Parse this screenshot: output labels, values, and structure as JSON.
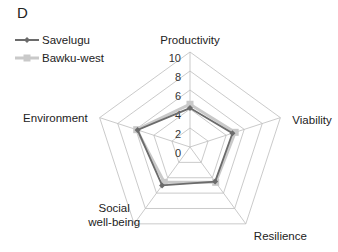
{
  "chart_data": {
    "type": "radar",
    "panel_label": "D",
    "axes": [
      "Productivity",
      "Viability",
      "Resilience",
      "Social well-being",
      "Environment"
    ],
    "axis_label_lines": [
      [
        "Productivity"
      ],
      [
        "Viability"
      ],
      [
        "Resilience"
      ],
      [
        "Social",
        "well-being"
      ],
      [
        "Environment"
      ]
    ],
    "rlim": [
      0,
      10
    ],
    "ticks": [
      0,
      2,
      4,
      6,
      8,
      10
    ],
    "tick_labels": [
      "0",
      "2",
      "4",
      "6",
      "8",
      "10"
    ],
    "grid": true,
    "legend_position": "top-left",
    "series": [
      {
        "name": "Savelugu",
        "color": "#6b6b6b",
        "marker": "diamond",
        "values": [
          4.1,
          4.7,
          4.5,
          5.0,
          5.8
        ]
      },
      {
        "name": "Bawku-west",
        "color": "#c9c9c9",
        "marker": "square",
        "values": [
          4.5,
          5.0,
          4.6,
          4.6,
          5.9
        ]
      }
    ]
  }
}
